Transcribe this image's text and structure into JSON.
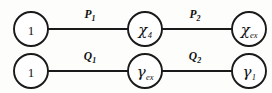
{
  "diagram": {
    "type": "two-chain-graph",
    "background_color": "#fdfdfc",
    "stroke_color": "#1a1a1a",
    "rows": [
      {
        "name": "top-chain",
        "nodes": [
          {
            "id": "top-n1",
            "base": "1",
            "sub": "",
            "cx": 31,
            "cy": 29,
            "r": 17
          },
          {
            "id": "top-n2",
            "base": "χ",
            "sub": "4",
            "cx": 145,
            "cy": 29,
            "r": 17
          },
          {
            "id": "top-n3",
            "base": "χ",
            "sub": "ex",
            "cx": 249,
            "cy": 29,
            "r": 17
          }
        ],
        "edges": [
          {
            "id": "edge-p1",
            "base": "P",
            "sub": "1",
            "x1": 48,
            "x2": 128,
            "y": 29,
            "lx": 90,
            "ly": 15
          },
          {
            "id": "edge-p2",
            "base": "P",
            "sub": "2",
            "x1": 162,
            "x2": 232,
            "y": 29,
            "lx": 195,
            "ly": 15
          }
        ]
      },
      {
        "name": "bottom-chain",
        "nodes": [
          {
            "id": "bot-n1",
            "base": "1",
            "sub": "",
            "cx": 31,
            "cy": 71,
            "r": 17
          },
          {
            "id": "bot-n2",
            "base": "γ",
            "sub": "ex",
            "cx": 145,
            "cy": 71,
            "r": 17
          },
          {
            "id": "bot-n3",
            "base": "γ",
            "sub": "1",
            "cx": 249,
            "cy": 71,
            "r": 17
          }
        ],
        "edges": [
          {
            "id": "edge-q1",
            "base": "Q",
            "sub": "1",
            "x1": 48,
            "x2": 128,
            "y": 71,
            "lx": 90,
            "ly": 57
          },
          {
            "id": "edge-q2",
            "base": "Q",
            "sub": "2",
            "x1": 162,
            "x2": 232,
            "y": 71,
            "lx": 195,
            "ly": 57
          }
        ]
      }
    ]
  }
}
